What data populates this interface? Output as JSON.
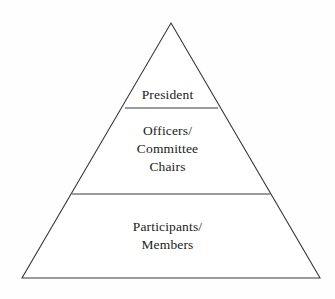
{
  "diagram": {
    "type": "pyramid-hierarchy",
    "background_color": "#fefefe",
    "stroke_color": "#3a3a3a",
    "text_color": "#1c1c1c",
    "geometry": {
      "apex": {
        "x": 171,
        "y": 23
      },
      "base_left": {
        "x": 22,
        "y": 278
      },
      "base_right": {
        "x": 320,
        "y": 278
      },
      "divider_1": {
        "y": 108,
        "x_left": 125,
        "x_right": 218
      },
      "divider_2": {
        "y": 194,
        "x_left": 72,
        "x_right": 270
      }
    },
    "tiers": [
      {
        "id": "top",
        "rank": 1,
        "lines": [
          "President"
        ]
      },
      {
        "id": "middle",
        "rank": 2,
        "lines": [
          "Officers/",
          "Committee",
          "Chairs"
        ]
      },
      {
        "id": "bottom",
        "rank": 3,
        "lines": [
          "Participants/",
          "Members"
        ]
      }
    ]
  }
}
